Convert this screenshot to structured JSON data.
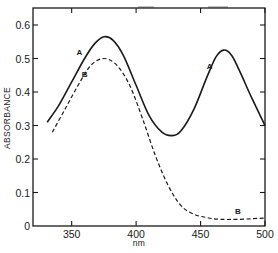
{
  "chart_data": {
    "type": "line",
    "title": "",
    "xlabel": "nm",
    "ylabel": "ABSORBANCE",
    "xlim": [
      320,
      500
    ],
    "ylim": [
      0,
      0.65
    ],
    "x_ticks": [
      350,
      400,
      450,
      500
    ],
    "x_tick_labels": [
      "350",
      "400",
      "450",
      "500"
    ],
    "y_ticks": [
      0,
      0.1,
      0.2,
      0.3,
      0.4,
      0.5,
      0.6
    ],
    "y_tick_labels": [
      "0",
      "0.1",
      "0.2",
      "0.3",
      "0.4",
      "0.5",
      "0.6"
    ],
    "grid": false,
    "legend": "inline curve labels",
    "series": [
      {
        "name": "A",
        "style": "solid",
        "color": "#1a1a1a",
        "x": [
          331,
          340,
          350,
          360,
          368,
          375,
          382,
          390,
          400,
          410,
          420,
          428,
          435,
          445,
          455,
          462,
          468,
          474,
          480,
          490,
          500
        ],
        "y": [
          0.31,
          0.36,
          0.43,
          0.5,
          0.545,
          0.565,
          0.555,
          0.51,
          0.42,
          0.33,
          0.28,
          0.27,
          0.285,
          0.35,
          0.445,
          0.505,
          0.525,
          0.51,
          0.465,
          0.38,
          0.3
        ],
        "labels": [
          {
            "text": "A",
            "x": 356,
            "y": 0.51
          },
          {
            "text": "A",
            "x": 457,
            "y": 0.47
          }
        ]
      },
      {
        "name": "B",
        "style": "dashed",
        "color": "#1a1a1a",
        "x": [
          335,
          345,
          355,
          365,
          375,
          385,
          395,
          405,
          415,
          425,
          435,
          445,
          455,
          465,
          480,
          500
        ],
        "y": [
          0.28,
          0.35,
          0.42,
          0.48,
          0.5,
          0.48,
          0.42,
          0.32,
          0.21,
          0.12,
          0.06,
          0.035,
          0.025,
          0.02,
          0.02,
          0.024
        ],
        "labels": [
          {
            "text": "B",
            "x": 360,
            "y": 0.445
          },
          {
            "text": "B",
            "x": 479,
            "y": 0.035
          }
        ]
      }
    ]
  }
}
